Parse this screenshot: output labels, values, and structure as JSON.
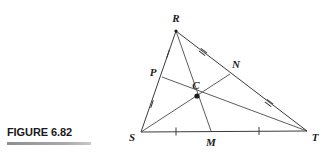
{
  "figure": {
    "caption": "FIGURE 6.82",
    "rule_color": "#8e8e93"
  },
  "diagram": {
    "type": "geometry-triangle-medians",
    "shape_name": "triangle RST with medians meeting at centroid C",
    "stroke_color": "#3a3a3a",
    "label_color": "#1c1c1c",
    "background": "#ffffff",
    "points": {
      "R": {
        "label": "R",
        "x": 176,
        "y": 31,
        "label_x": 176,
        "label_y": 22
      },
      "S": {
        "label": "S",
        "x": 141,
        "y": 132,
        "label_x": 132,
        "label_y": 141
      },
      "T": {
        "label": "T",
        "x": 307,
        "y": 131,
        "label_x": 315,
        "label_y": 141
      },
      "M": {
        "label": "M",
        "x": 211,
        "y": 131,
        "label_x": 211,
        "label_y": 146
      },
      "N": {
        "label": "N",
        "x": 230,
        "y": 74,
        "label_x": 236,
        "label_y": 68
      },
      "P": {
        "label": "P",
        "x": 162,
        "y": 77,
        "label_x": 153,
        "label_y": 76
      },
      "C": {
        "label": "C",
        "x": 197,
        "y": 96,
        "label_x": 196,
        "label_y": 89
      }
    },
    "sides": [
      {
        "name": "side-RS",
        "from": "R",
        "to": "S"
      },
      {
        "name": "side-RT",
        "from": "R",
        "to": "T"
      },
      {
        "name": "side-ST",
        "from": "S",
        "to": "T"
      }
    ],
    "medians": [
      {
        "name": "median-RM",
        "from": "R",
        "to": "M"
      },
      {
        "name": "median-SN",
        "from": "S",
        "to": "N"
      },
      {
        "name": "median-TP",
        "from": "T",
        "to": "P"
      }
    ],
    "congruence_marks": [
      {
        "name": "tick-RP",
        "segment": "RP",
        "count": 1,
        "x": 168,
        "y": 54,
        "angle": -71
      },
      {
        "name": "tick-PS",
        "segment": "PS",
        "count": 1,
        "x": 152,
        "y": 104,
        "angle": -71
      },
      {
        "name": "tick-RN",
        "segment": "RN",
        "count": 2,
        "x": 203,
        "y": 52,
        "angle": 38
      },
      {
        "name": "tick-NT",
        "segment": "NT",
        "count": 2,
        "x": 269,
        "y": 103,
        "angle": 38
      },
      {
        "name": "tick-SM",
        "segment": "SM",
        "count": 1,
        "x": 176,
        "y": 131,
        "angle": 0
      },
      {
        "name": "tick-MT",
        "segment": "MT",
        "count": 1,
        "x": 259,
        "y": 131,
        "angle": 0
      }
    ]
  }
}
